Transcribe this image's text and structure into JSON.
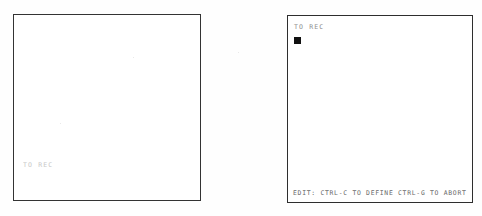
{
  "figure": {
    "kind": "terminal-screen-pair",
    "background_color": "#fefefe",
    "border_color": "#2e2e2e"
  },
  "screens": [
    {
      "id": "left",
      "name": "before-state",
      "prompt": "TO REC",
      "prompt_color": "#c6c6c6",
      "cursor_visible": false,
      "status_line": ""
    },
    {
      "id": "right",
      "name": "after-state",
      "prompt": "TO REC",
      "prompt_color": "#8d8d8d",
      "cursor_visible": true,
      "cursor_color": "#111111",
      "status_line": "EDIT: CTRL-C TO DEFINE CTRL-G TO ABORT"
    }
  ]
}
